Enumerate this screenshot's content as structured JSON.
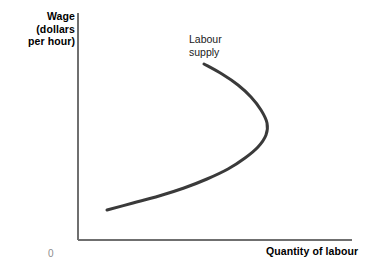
{
  "figure": {
    "width": 372,
    "height": 269,
    "background_color": "#ffffff"
  },
  "axes": {
    "y_axis_label": "Wage\n(dollars\nper hour)",
    "x_axis_label": "Quantity of labour",
    "origin_label": "0",
    "axis_color": "#6f6f6f",
    "origin_label_color": "#8d8d8d",
    "label_color": "#000000"
  },
  "annotations": [
    {
      "name": "labour-supply",
      "text": "Labour\nsupply",
      "color": "#1a1a1a"
    }
  ],
  "chart_data": {
    "type": "line",
    "title": "",
    "subtitle": "",
    "xlabel": "Quantity of labour",
    "ylabel": "Wage (dollars per hour)",
    "grid": false,
    "legend_position": "inline-annotation",
    "axis_origin_label": "0",
    "xlim": [
      0,
      1
    ],
    "ylim": [
      0,
      1
    ],
    "xtick_labels": [],
    "ytick_labels": [],
    "series": [
      {
        "name": "Labour supply",
        "description": "Backward-bending labour supply curve: wage rises with hours supplied up to a turning point, after which further wage increases reduce hours supplied.",
        "color": "#3a3a3a",
        "line_width": 3,
        "points_px": [
          [
            204,
            64
          ],
          [
            222,
            74
          ],
          [
            238,
            85
          ],
          [
            251,
            97
          ],
          [
            261,
            110
          ],
          [
            267,
            123
          ],
          [
            266,
            135
          ],
          [
            258,
            147
          ],
          [
            245,
            158
          ],
          [
            228,
            169
          ],
          [
            207,
            179
          ],
          [
            184,
            188
          ],
          [
            159,
            196
          ],
          [
            133,
            203
          ],
          [
            107,
            210
          ]
        ],
        "points_normalized": [
          [
            0.46,
            0.775
          ],
          [
            0.526,
            0.731
          ],
          [
            0.584,
            0.683
          ],
          [
            0.631,
            0.63
          ],
          [
            0.668,
            0.573
          ],
          [
            0.69,
            0.515
          ],
          [
            0.686,
            0.463
          ],
          [
            0.657,
            0.41
          ],
          [
            0.609,
            0.361
          ],
          [
            0.547,
            0.313
          ],
          [
            0.47,
            0.269
          ],
          [
            0.387,
            0.229
          ],
          [
            0.296,
            0.193
          ],
          [
            0.201,
            0.163
          ],
          [
            0.106,
            0.132
          ]
        ],
        "turning_point_px": [
          268,
          125
        ],
        "start_point_px": [
          107,
          210
        ],
        "end_point_px": [
          204,
          64
        ]
      }
    ]
  },
  "geometry": {
    "y_axis_x": 78,
    "y_axis_top": 13,
    "y_axis_bottom": 240,
    "x_axis_y": 240,
    "x_axis_left": 78,
    "x_axis_right": 352
  }
}
